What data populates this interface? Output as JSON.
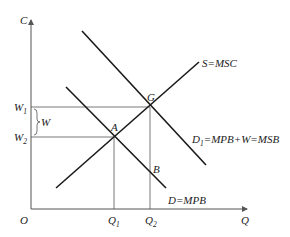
{
  "diagram": {
    "type": "economics-externality",
    "axes": {
      "y_label": "C",
      "x_label": "Q",
      "origin_label": "O"
    },
    "curves": [
      {
        "id": "supply",
        "label": "S=MSC"
      },
      {
        "id": "demand_social",
        "label_main": "D",
        "label_sub": "1",
        "label_rest": "=MPB+W=MSB"
      },
      {
        "id": "demand_private",
        "label": "D=MPB"
      }
    ],
    "points": [
      {
        "id": "G",
        "label": "G"
      },
      {
        "id": "A",
        "label": "A"
      },
      {
        "id": "B",
        "label": "B"
      }
    ],
    "y_ticks": [
      {
        "main": "W",
        "sub": "1"
      },
      {
        "main": "W",
        "sub": "2"
      }
    ],
    "x_ticks": [
      {
        "main": "Q",
        "sub": "1"
      },
      {
        "main": "Q",
        "sub": "2"
      }
    ],
    "bracket_label": "W"
  }
}
